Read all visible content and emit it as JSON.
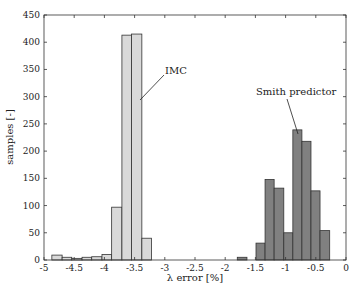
{
  "chart_data": {
    "type": "bar",
    "title": "",
    "xlabel": "λ error [%]",
    "ylabel": "samples [-]",
    "xlim": [
      -5,
      0
    ],
    "ylim": [
      0,
      450
    ],
    "xticks": [
      "-5",
      "-4.5",
      "-4",
      "-3.5",
      "-3",
      "-2.5",
      "-2",
      "-1.5",
      "-1",
      "-0.5",
      "0"
    ],
    "yticks": [
      "0",
      "50",
      "100",
      "150",
      "200",
      "250",
      "300",
      "350",
      "400",
      "450"
    ],
    "grid": false,
    "series": [
      {
        "name": "IMC",
        "color": "#d9d9d9",
        "bin_edges": [
          -4.87,
          -4.7,
          -4.54,
          -4.37,
          -4.21,
          -4.04,
          -3.88,
          -3.71,
          -3.55,
          -3.38,
          -3.22
        ],
        "values": [
          9,
          5,
          3,
          5,
          6,
          10,
          97,
          413,
          415,
          40
        ]
      },
      {
        "name": "Smith predictor",
        "color": "#808080",
        "bin_edges": [
          -1.8,
          -1.64
        ],
        "values": [
          5
        ],
        "bin_edges_main": [
          -1.49,
          -1.34,
          -1.19,
          -1.03,
          -0.88,
          -0.73,
          -0.58,
          -0.43,
          -0.27
        ],
        "values_main": [
          31,
          148,
          132,
          50,
          239,
          218,
          127,
          54
        ]
      }
    ],
    "annotations": [
      {
        "text": "IMC",
        "x": -3.55,
        "y": 350
      },
      {
        "text": "Smith predictor",
        "x": -0.8,
        "y": 310
      }
    ]
  }
}
